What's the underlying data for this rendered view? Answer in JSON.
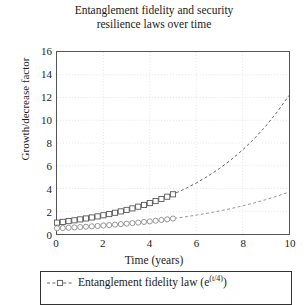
{
  "chart_data": {
    "type": "line",
    "title": "Entanglement fidelity and security resilience laws over time",
    "title_line1": "Entanglement fidelity and security",
    "title_line2": "resilience laws over time",
    "xlabel": "Time (years)",
    "ylabel": "Growth/decrease factor",
    "xlim": [
      0,
      10
    ],
    "ylim": [
      0,
      16
    ],
    "xticks": [
      0,
      2,
      4,
      6,
      8,
      10
    ],
    "yticks": [
      0,
      2,
      4,
      6,
      8,
      10,
      12,
      14,
      16
    ],
    "grid": "dotted-faint",
    "legend_position": "below-axes",
    "x": [
      0,
      0.25,
      0.5,
      0.75,
      1,
      1.25,
      1.5,
      1.75,
      2,
      2.25,
      2.5,
      2.75,
      3,
      3.25,
      3.5,
      3.75,
      4,
      4.25,
      4.5,
      4.75,
      5,
      5.5,
      6,
      6.5,
      7,
      7.5,
      8,
      8.5,
      9,
      9.5,
      10
    ],
    "series": [
      {
        "name": "Entanglement fidelity law (e^(t/4))",
        "label_text": "Entanglement fidelity law (e",
        "label_exp": "(t/4)",
        "label_tail": ")",
        "marker": "square",
        "linestyle": "dashed",
        "color": "#555555",
        "marker_range": [
          0,
          5
        ],
        "values": [
          1.0,
          1.065,
          1.133,
          1.206,
          1.284,
          1.366,
          1.455,
          1.548,
          1.649,
          1.755,
          1.868,
          1.989,
          2.117,
          2.254,
          2.399,
          2.554,
          2.718,
          2.894,
          3.08,
          3.279,
          3.49,
          3.953,
          4.482,
          5.078,
          5.755,
          6.52,
          7.389,
          8.372,
          9.488,
          10.75,
          12.18
        ]
      },
      {
        "name": "Security resilience law (0.5*e^(t/5))",
        "label_text": "Security resilience law (0.5e",
        "label_exp": "(t/5)",
        "label_tail": ")",
        "marker": "circle",
        "linestyle": "dashed",
        "color": "#8a8a8a",
        "marker_range": [
          0,
          5
        ],
        "values": [
          0.5,
          0.526,
          0.553,
          0.581,
          0.611,
          0.642,
          0.675,
          0.709,
          0.746,
          0.784,
          0.824,
          0.866,
          0.911,
          0.957,
          1.006,
          1.058,
          1.112,
          1.169,
          1.229,
          1.292,
          1.359,
          1.501,
          1.659,
          1.833,
          2.025,
          2.238,
          2.473,
          2.732,
          3.019,
          3.336,
          3.695
        ]
      }
    ]
  },
  "legend": {
    "entries": [
      {
        "text": "Entanglement fidelity law (e",
        "exp": "(t/4)",
        "tail": ")"
      }
    ]
  }
}
